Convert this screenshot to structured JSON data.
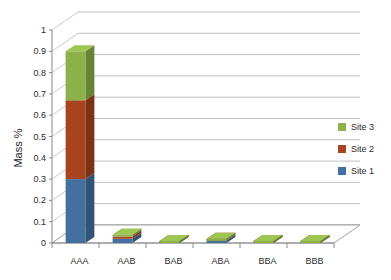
{
  "chart_data": {
    "type": "bar",
    "subtype": "stacked-column-3d",
    "title": "",
    "subtitle": "",
    "xlabel": "",
    "ylabel": "Mass %",
    "categories": [
      "AAA",
      "AAB",
      "BAB",
      "ABA",
      "BBA",
      "BBB"
    ],
    "series": [
      {
        "name": "Site 1",
        "color": "#44709f",
        "values": [
          0.3,
          0.02,
          0.0,
          0.01,
          0.0,
          0.0
        ]
      },
      {
        "name": "Site 2",
        "color": "#a8431f",
        "values": [
          0.37,
          0.01,
          0.0,
          0.0,
          0.0,
          0.0
        ]
      },
      {
        "name": "Site 3",
        "color": "#8cb14a",
        "values": [
          0.23,
          0.01,
          0.0,
          0.01,
          0.0,
          0.0
        ]
      }
    ],
    "totals": [
      0.9,
      0.04,
      0.0,
      0.02,
      0.0,
      0.0
    ],
    "ylim": [
      0,
      1
    ],
    "ytick_step": 0.1,
    "ytick_labels": [
      "1",
      "0.9",
      "0.8",
      "0.7",
      "0.6",
      "0.5",
      "0.4",
      "0.3",
      "0.2",
      "0.1",
      "0"
    ],
    "ytick_values": [
      1,
      0.9,
      0.8,
      0.7,
      0.6,
      0.5,
      0.4,
      0.3,
      0.2,
      0.1,
      0
    ],
    "grid": true,
    "grid_orientation": "horizontal",
    "legend": {
      "position": "right",
      "entries": [
        {
          "label": "Site 3",
          "color": "#8cb14a"
        },
        {
          "label": "Site 2",
          "color": "#a8431f"
        },
        {
          "label": "Site 1",
          "color": "#44709f"
        }
      ]
    },
    "colors": {
      "site_1": "#44709f",
      "site_2": "#a8431f",
      "site_3": "#8cb14a",
      "gridline": "#b9b9b9",
      "axis": "#8a8a8a",
      "text": "#2b2b2b",
      "background": "#ffffff"
    }
  },
  "axis": {
    "y_label": "Mass %",
    "y_ticks": [
      "1",
      "0.9",
      "0.8",
      "0.7",
      "0.6",
      "0.5",
      "0.4",
      "0.3",
      "0.2",
      "0.1",
      "0"
    ],
    "x_categories": [
      "AAA",
      "AAB",
      "BAB",
      "ABA",
      "BBA",
      "BBB"
    ]
  },
  "legend": {
    "items": [
      {
        "label": "Site 3"
      },
      {
        "label": "Site 2"
      },
      {
        "label": "Site 1"
      }
    ]
  }
}
